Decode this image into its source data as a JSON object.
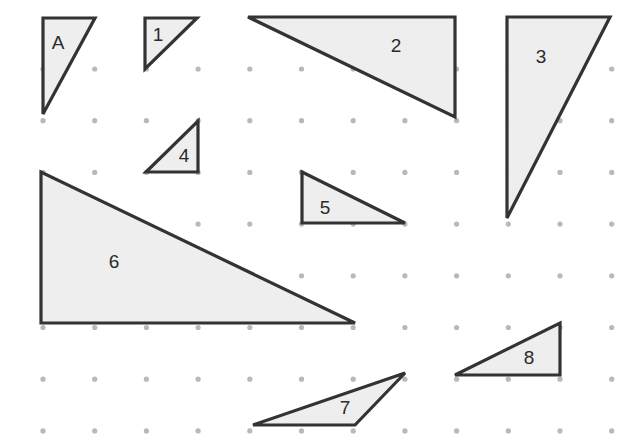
{
  "figure": {
    "canvas": {
      "width": 642,
      "height": 441,
      "background": "#ffffff"
    },
    "style": {
      "shape_fill": "#eeeeee",
      "shape_stroke": "#333333",
      "shape_stroke_width": 3.2,
      "dot_color": "#b9b9b9",
      "dot_radius": 2.6,
      "label_color": "#2b2b2b",
      "label_font_size": 19
    },
    "grid": {
      "type": "dot-lattice",
      "spacing_px": 51.7,
      "origin_x": 43,
      "origin_y": 69,
      "columns": 12,
      "rows": 8,
      "x_positions": [
        43,
        94.7,
        146.4,
        198.1,
        249.8,
        301.5,
        353.2,
        404.9,
        456.6,
        508.3,
        560,
        611.7
      ],
      "y_positions": [
        69,
        120.7,
        172.4,
        224.1,
        275.8,
        327.5,
        379.2,
        430.9
      ]
    },
    "shapes": [
      {
        "id": "triangle-a",
        "label": "A",
        "label_x": 58,
        "label_y": 44,
        "points": "43,18 95,18 43,114",
        "vertices": [
          [
            43,
            18
          ],
          [
            95,
            18
          ],
          [
            43,
            114
          ]
        ],
        "orientation": "right-angle-top-left"
      },
      {
        "id": "triangle-1",
        "label": "1",
        "label_x": 158,
        "label_y": 36,
        "points": "145,18 197,18 145,69",
        "vertices": [
          [
            145,
            18
          ],
          [
            197,
            18
          ],
          [
            145,
            69
          ]
        ],
        "orientation": "right-angle-top-left"
      },
      {
        "id": "triangle-2",
        "label": "2",
        "label_x": 396,
        "label_y": 47,
        "points": "248,17 455,17 455,117",
        "vertices": [
          [
            248,
            17
          ],
          [
            455,
            17
          ],
          [
            455,
            117
          ]
        ],
        "orientation": "right-angle-top-right"
      },
      {
        "id": "triangle-3",
        "label": "3",
        "label_x": 541,
        "label_y": 58,
        "points": "507,17 610,17 507,218",
        "vertices": [
          [
            507,
            17
          ],
          [
            610,
            17
          ],
          [
            507,
            218
          ]
        ],
        "orientation": "right-angle-top-left"
      },
      {
        "id": "triangle-4",
        "label": "4",
        "label_x": 184,
        "label_y": 157,
        "points": "198,121 198,172 146,172",
        "vertices": [
          [
            198,
            121
          ],
          [
            198,
            172
          ],
          [
            146,
            172
          ]
        ],
        "orientation": "right-angle-bottom-right"
      },
      {
        "id": "triangle-5",
        "label": "5",
        "label_x": 325,
        "label_y": 209,
        "points": "302,172 405,223 302,223",
        "vertices": [
          [
            302,
            172
          ],
          [
            405,
            223
          ],
          [
            302,
            223
          ]
        ],
        "orientation": "right-angle-bottom-left"
      },
      {
        "id": "triangle-6",
        "label": "6",
        "label_x": 114,
        "label_y": 263,
        "points": "41,172 41,323 355,323",
        "vertices": [
          [
            41,
            172
          ],
          [
            41,
            323
          ],
          [
            355,
            323
          ]
        ],
        "orientation": "right-angle-bottom-left"
      },
      {
        "id": "triangle-7",
        "label": "7",
        "label_x": 345,
        "label_y": 409,
        "points": "253,425 405,373 355,425",
        "vertices": [
          [
            253,
            425
          ],
          [
            405,
            373
          ],
          [
            355,
            425
          ]
        ],
        "orientation": "oblique"
      },
      {
        "id": "triangle-8",
        "label": "8",
        "label_x": 529,
        "label_y": 359,
        "points": "455,375 560,323 560,375",
        "vertices": [
          [
            455,
            375
          ],
          [
            560,
            323
          ],
          [
            560,
            375
          ]
        ],
        "orientation": "right-angle-bottom-right"
      }
    ]
  }
}
